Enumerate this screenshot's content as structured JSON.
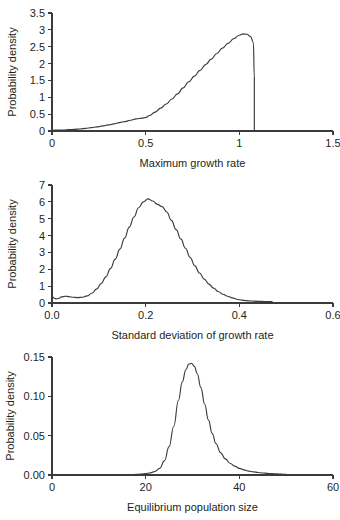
{
  "figure": {
    "background": "#ffffff",
    "ink_color": "#3b3b3b",
    "text_color": "#231f20",
    "panel_count": 3
  },
  "chart_data": [
    {
      "type": "line",
      "title": "",
      "xlabel": "Maximum growth rate",
      "ylabel": "Probability density",
      "xlim": [
        0,
        1.5
      ],
      "ylim": [
        0,
        3.5
      ],
      "xticks": [
        0,
        0.5,
        1,
        1.5
      ],
      "xticklabels": [
        "0",
        "0.5",
        "1",
        "1.5"
      ],
      "yticks": [
        0,
        0.5,
        1,
        1.5,
        2,
        2.5,
        3,
        3.5
      ],
      "yticklabels": [
        "0",
        "0.5",
        "1",
        "1.5",
        "2",
        "2.5",
        "3",
        "3.5"
      ],
      "grid": false,
      "legend": "none",
      "x": [
        0.0,
        0.03,
        0.06,
        0.09,
        0.12,
        0.15,
        0.18,
        0.21,
        0.24,
        0.27,
        0.3,
        0.33,
        0.36,
        0.39,
        0.42,
        0.45,
        0.48,
        0.5,
        0.52,
        0.55,
        0.58,
        0.61,
        0.64,
        0.67,
        0.7,
        0.73,
        0.76,
        0.79,
        0.82,
        0.85,
        0.88,
        0.91,
        0.94,
        0.97,
        1.0,
        1.02,
        1.04,
        1.06,
        1.075,
        1.08,
        1.08
      ],
      "y": [
        0.02,
        0.03,
        0.03,
        0.04,
        0.05,
        0.06,
        0.08,
        0.1,
        0.12,
        0.15,
        0.18,
        0.21,
        0.25,
        0.28,
        0.32,
        0.36,
        0.38,
        0.4,
        0.46,
        0.56,
        0.68,
        0.8,
        0.95,
        1.1,
        1.28,
        1.46,
        1.63,
        1.8,
        1.97,
        2.13,
        2.3,
        2.46,
        2.6,
        2.74,
        2.84,
        2.88,
        2.87,
        2.8,
        2.62,
        1.6,
        0.0
      ]
    },
    {
      "type": "line",
      "title": "",
      "xlabel": "Standard deviation of growth rate",
      "ylabel": "Probability density",
      "xlim": [
        0.0,
        0.6
      ],
      "ylim": [
        0,
        7
      ],
      "xticks": [
        0.0,
        0.2,
        0.4,
        0.6
      ],
      "xticklabels": [
        "0.0",
        "0.2",
        "0.4",
        "0.6"
      ],
      "yticks": [
        0,
        1,
        2,
        3,
        4,
        5,
        6,
        7
      ],
      "yticklabels": [
        "0",
        "1",
        "2",
        "3",
        "4",
        "5",
        "6",
        "7"
      ],
      "grid": false,
      "legend": "none",
      "x": [
        0.0,
        0.005,
        0.01,
        0.015,
        0.02,
        0.028,
        0.036,
        0.045,
        0.055,
        0.065,
        0.075,
        0.085,
        0.095,
        0.105,
        0.115,
        0.125,
        0.135,
        0.145,
        0.155,
        0.165,
        0.175,
        0.185,
        0.195,
        0.205,
        0.215,
        0.225,
        0.235,
        0.245,
        0.255,
        0.265,
        0.275,
        0.285,
        0.295,
        0.305,
        0.315,
        0.325,
        0.335,
        0.345,
        0.355,
        0.365,
        0.375,
        0.385,
        0.395,
        0.405,
        0.415,
        0.425,
        0.44,
        0.455,
        0.47
      ],
      "y": [
        0.38,
        0.28,
        0.24,
        0.28,
        0.36,
        0.4,
        0.38,
        0.34,
        0.32,
        0.34,
        0.42,
        0.58,
        0.82,
        1.15,
        1.55,
        2.05,
        2.6,
        3.2,
        3.85,
        4.5,
        5.1,
        5.65,
        6.0,
        6.18,
        6.05,
        5.85,
        5.72,
        5.4,
        4.9,
        4.35,
        3.8,
        3.25,
        2.7,
        2.2,
        1.78,
        1.42,
        1.12,
        0.88,
        0.68,
        0.52,
        0.4,
        0.3,
        0.22,
        0.17,
        0.14,
        0.12,
        0.1,
        0.09,
        0.08
      ]
    },
    {
      "type": "line",
      "title": "",
      "xlabel": "Equilibrium population size",
      "ylabel": "Probability density",
      "xlim": [
        0,
        60
      ],
      "ylim": [
        0,
        0.15
      ],
      "xticks": [
        0,
        20,
        40,
        60
      ],
      "xticklabels": [
        "0",
        "20",
        "40",
        "60"
      ],
      "yticks": [
        0.0,
        0.05,
        0.1,
        0.15
      ],
      "yticklabels": [
        "0.00",
        "0.05",
        "0.10",
        "0.15"
      ],
      "grid": false,
      "legend": "none",
      "x": [
        17.0,
        18.0,
        19.0,
        20.0,
        21.0,
        22.0,
        23.0,
        24.0,
        25.0,
        26.0,
        27.0,
        27.8,
        28.6,
        29.2,
        29.8,
        30.4,
        31.0,
        31.8,
        32.6,
        33.4,
        34.2,
        35.0,
        36.0,
        37.0,
        38.0,
        39.0,
        40.0,
        41.0,
        42.0,
        43.0,
        44.0,
        45.0,
        46.0,
        47.0,
        48.0,
        49.0,
        50.0
      ],
      "y": [
        0.0005,
        0.0008,
        0.0012,
        0.0018,
        0.0028,
        0.0045,
        0.0085,
        0.018,
        0.036,
        0.062,
        0.095,
        0.118,
        0.134,
        0.141,
        0.142,
        0.138,
        0.129,
        0.111,
        0.09,
        0.07,
        0.053,
        0.04,
        0.0285,
        0.0205,
        0.015,
        0.0112,
        0.0085,
        0.0065,
        0.005,
        0.004,
        0.0032,
        0.0026,
        0.0021,
        0.0017,
        0.0014,
        0.0011,
        0.0009
      ]
    }
  ]
}
